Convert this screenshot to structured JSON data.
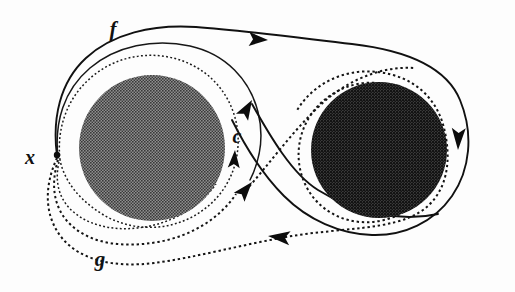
{
  "figure": {
    "kind": "mathematical-diagram",
    "background_color": "#fdfdfd",
    "ink_color": "#111111",
    "width": 515,
    "height": 292
  },
  "labels": [
    {
      "id": "f",
      "text": "f",
      "x": 113,
      "y": 36,
      "font_size": 21,
      "meaning": "loop-f-label"
    },
    {
      "id": "x",
      "text": "x",
      "x": 30,
      "y": 164,
      "font_size": 20,
      "meaning": "basepoint-label"
    },
    {
      "id": "c",
      "text": "c",
      "x": 237,
      "y": 143,
      "font_size": 20,
      "meaning": "loop-c-label"
    },
    {
      "id": "g",
      "text": "g",
      "x": 100,
      "y": 266,
      "font_size": 21,
      "meaning": "loop-g-label"
    }
  ],
  "basepoint": {
    "name": "x",
    "x": 57,
    "y": 155
  },
  "discs": [
    {
      "name": "left-disc",
      "cx": 152,
      "cy": 148,
      "r": 73,
      "fill": "#5e5e5e",
      "texture": "halftone-medium"
    },
    {
      "name": "right-disc",
      "cx": 379,
      "cy": 150,
      "r": 68,
      "fill": "#2b2b2b",
      "texture": "halftone-dark"
    }
  ],
  "curves": [
    {
      "name": "loop-f-outer",
      "style": "solid",
      "label": "f",
      "direction": "clockwise-from-basepoint",
      "note": "Outer solid curve leaving x, over the left disc, across the top to the far right, down around the right disc and back"
    },
    {
      "name": "loop-f-inner",
      "style": "solid",
      "label": "f",
      "note": "Second solid strand hugging the left disc, returning to x"
    },
    {
      "name": "loop-c-solid-diagonal",
      "style": "solid",
      "label": "c",
      "note": "Solid diagonal from the lower right loop crossing up to the left loop"
    },
    {
      "name": "loop-g-outer",
      "style": "dotted",
      "label": "g",
      "direction": "counter-clockwise-from-basepoint",
      "note": "Outer dotted curve from x sweeping under the left disc, across to the right disc and around it"
    },
    {
      "name": "loop-g-middle",
      "style": "dotted",
      "label": "g",
      "note": "Middle dotted strand below the left disc"
    },
    {
      "name": "loop-c-dotted-ring",
      "style": "dotted",
      "label": "c",
      "note": "Dotted ring encircling the left disc"
    },
    {
      "name": "loop-c-dotted-diagonal",
      "style": "dotted",
      "label": "c",
      "note": "Dotted diagonal crossing the solid diagonal near the centre"
    },
    {
      "name": "right-disc-dotted-ring",
      "style": "dotted",
      "note": "Dotted ring encircling the right disc"
    }
  ],
  "arrows": [
    {
      "name": "arrow-f-top",
      "x": 268,
      "y": 40,
      "angle": 0,
      "on": "loop-f-outer",
      "points": "right"
    },
    {
      "name": "arrow-f-right-outer",
      "x": 456,
      "y": 142,
      "angle": 90,
      "on": "loop-f-outer",
      "points": "down"
    },
    {
      "name": "arrow-g-right-inner",
      "x": 434,
      "y": 142,
      "angle": 90,
      "on": "right-disc-dotted-ring",
      "points": "down"
    },
    {
      "name": "arrow-g-bottom",
      "x": 277,
      "y": 236,
      "angle": 180,
      "on": "loop-g-outer",
      "points": "left"
    },
    {
      "name": "arrow-c-solid-diagonal",
      "x": 253,
      "y": 101,
      "angle": -56,
      "on": "loop-c-solid-diagonal",
      "points": "up-right"
    },
    {
      "name": "arrow-c-dotted-ring",
      "x": 233,
      "y": 157,
      "angle": -84,
      "on": "loop-c-dotted-ring",
      "points": "up"
    },
    {
      "name": "arrow-c-dotted-diagonal",
      "x": 249,
      "y": 186,
      "angle": -50,
      "on": "loop-c-dotted-diagonal",
      "points": "up-right"
    }
  ]
}
